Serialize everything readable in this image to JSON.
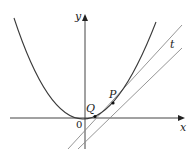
{
  "diagram": {
    "type": "parabola-tangent-secant",
    "labels": {
      "x_axis": "x",
      "y_axis": "y",
      "origin": "0",
      "point_p": "P",
      "point_q": "Q",
      "tangent": "t"
    },
    "colors": {
      "curve": "#3a3a3a",
      "axes": "#444444",
      "lines": "#8a8a8a",
      "points": "#111111"
    }
  }
}
